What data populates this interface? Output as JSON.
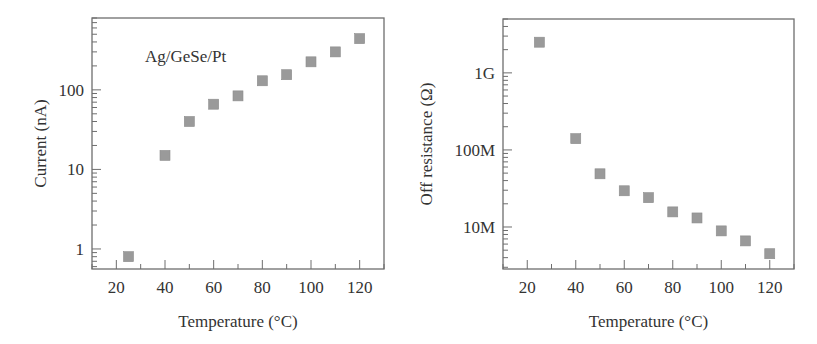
{
  "chart_data": [
    {
      "type": "scatter",
      "title": "",
      "annotation": "Ag/GeSe/Pt",
      "xlabel": "Temperature (°C)",
      "ylabel": "Current (nA)",
      "xscale": "linear",
      "yscale": "log",
      "xlim": [
        10,
        130
      ],
      "ylim": [
        0.56,
        800
      ],
      "xticks": [
        20,
        40,
        60,
        80,
        100,
        120
      ],
      "xtick_labels": [
        "20",
        "40",
        "60",
        "80",
        "100",
        "120"
      ],
      "yticks": [
        1,
        10,
        100
      ],
      "ytick_labels": [
        "1",
        "10",
        "100"
      ],
      "grid": false,
      "marker": "square",
      "marker_color": "#9a9a9a",
      "x": [
        25,
        40,
        50,
        60,
        70,
        80,
        90,
        100,
        110,
        120
      ],
      "y": [
        0.8,
        15,
        40,
        66,
        84,
        130,
        155,
        225,
        300,
        440
      ]
    },
    {
      "type": "scatter",
      "title": "",
      "xlabel": "Temperature (°C)",
      "ylabel": "Off resistance (Ω)",
      "xscale": "linear",
      "yscale": "log",
      "xlim": [
        10,
        130
      ],
      "ylim": [
        2850000.0,
        5000000000.0
      ],
      "xticks": [
        20,
        40,
        60,
        80,
        100,
        120
      ],
      "xtick_labels": [
        "20",
        "40",
        "60",
        "80",
        "100",
        "120"
      ],
      "yticks": [
        10000000.0,
        100000000.0,
        1000000000.0
      ],
      "ytick_labels": [
        "10M",
        "100M",
        "1G"
      ],
      "grid": false,
      "marker": "square",
      "marker_color": "#9a9a9a",
      "x": [
        25,
        40,
        50,
        60,
        70,
        80,
        90,
        100,
        110,
        120
      ],
      "y": [
        2500000000.0,
        140000000.0,
        49000000.0,
        29500000.0,
        24000000.0,
        15700000.0,
        13100000.0,
        8900000.0,
        6600000.0,
        4500000.0
      ]
    }
  ]
}
